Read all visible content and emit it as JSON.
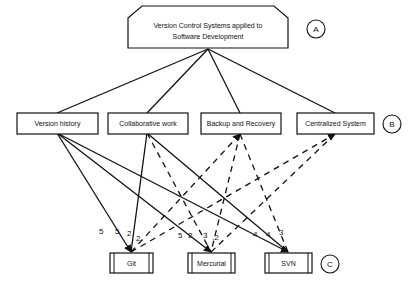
{
  "diagram": {
    "type": "hierarchy",
    "root": {
      "id": "A",
      "label_line1": "Version Control Systems applied to",
      "label_line2": "Software Development",
      "tag": "A"
    },
    "criteria": {
      "tag": "B",
      "items": [
        {
          "id": "vh",
          "label": "Version history"
        },
        {
          "id": "cw",
          "label": "Collaborative work"
        },
        {
          "id": "br",
          "label": "Backup and Recovery"
        },
        {
          "id": "cs",
          "label": "Centralized System"
        }
      ]
    },
    "alternatives": {
      "tag": "C",
      "items": [
        {
          "id": "git",
          "label": "Git"
        },
        {
          "id": "hg",
          "label": "Mercurial"
        },
        {
          "id": "svn",
          "label": "SVN"
        }
      ]
    },
    "edge_labels": {
      "vh_git": "5",
      "cw_git": "5",
      "br_git": "2",
      "cs_git": "2",
      "vh_hg": "5",
      "cw_hg": "2",
      "br_hg": "3",
      "cs_hg": ",2",
      "vh_svn": "4",
      "cw_svn": "4",
      "br_svn": "3"
    }
  }
}
